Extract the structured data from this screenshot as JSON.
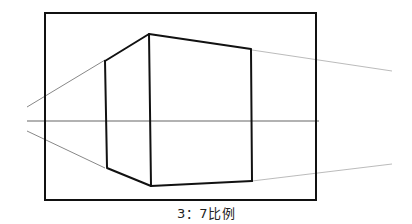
{
  "diagram": {
    "caption": "3：7比例",
    "colors": {
      "frame": "#111111",
      "box_edges": "#111111",
      "horizon": "#666666",
      "guide_lines": "#999999",
      "background": "#ffffff"
    },
    "frame": {
      "x": 45,
      "y": 13,
      "width": 271,
      "height": 187
    },
    "horizon": {
      "y": 121,
      "x1": 27,
      "x2": 319
    },
    "box": {
      "left_edge": {
        "x": 105,
        "top": 60,
        "bottom": 168
      },
      "front_edge": {
        "x": 149,
        "top": 34,
        "bottom": 186
      },
      "right_edge": {
        "x": 252,
        "top": 50,
        "bottom": 181
      }
    },
    "ratio_label": "3 : 7"
  }
}
